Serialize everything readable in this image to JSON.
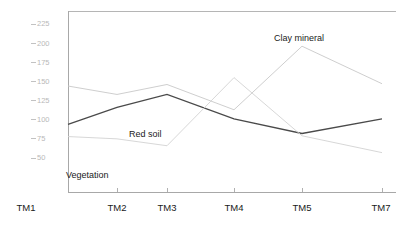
{
  "chart_data": {
    "type": "line",
    "title": "",
    "xlabel": "",
    "ylabel": "",
    "categories": [
      "TM1",
      "TM2",
      "TM3",
      "TM4",
      "TM5",
      "TM7"
    ],
    "yticks": [
      50,
      75,
      100,
      125,
      150,
      175,
      200,
      225
    ],
    "ytick_labels": [
      "50",
      "75",
      "100",
      "125",
      "150",
      "175",
      "200",
      "225"
    ],
    "ylim": [
      40,
      232
    ],
    "grid": false,
    "legend_position": "inline-annotations",
    "series": [
      {
        "name": "Clay mineral",
        "color": "#c8c8c8",
        "values": [
          144,
          133,
          146,
          113,
          196,
          147
        ],
        "label_x": 274,
        "label_y": 41
      },
      {
        "name": "Red soil",
        "color": "#4a4a4a",
        "values": [
          94,
          116,
          133,
          101,
          82,
          101
        ],
        "label_x": 129,
        "label_y": 137
      },
      {
        "name": "Vegetation",
        "color": "#d2d2d2",
        "values": [
          78,
          75,
          66,
          155,
          79,
          57
        ],
        "label_x": 66,
        "label_y": 178
      }
    ],
    "annotations": [
      {
        "text": "Clay mineral",
        "x": 274,
        "y": 41
      },
      {
        "text": "Red soil",
        "x": 129,
        "y": 137
      },
      {
        "text": "Vegetation",
        "x": 66,
        "y": 178
      }
    ]
  },
  "axes": {
    "y_axis_name": "y-axis",
    "x_axis_name": "x-axis"
  }
}
